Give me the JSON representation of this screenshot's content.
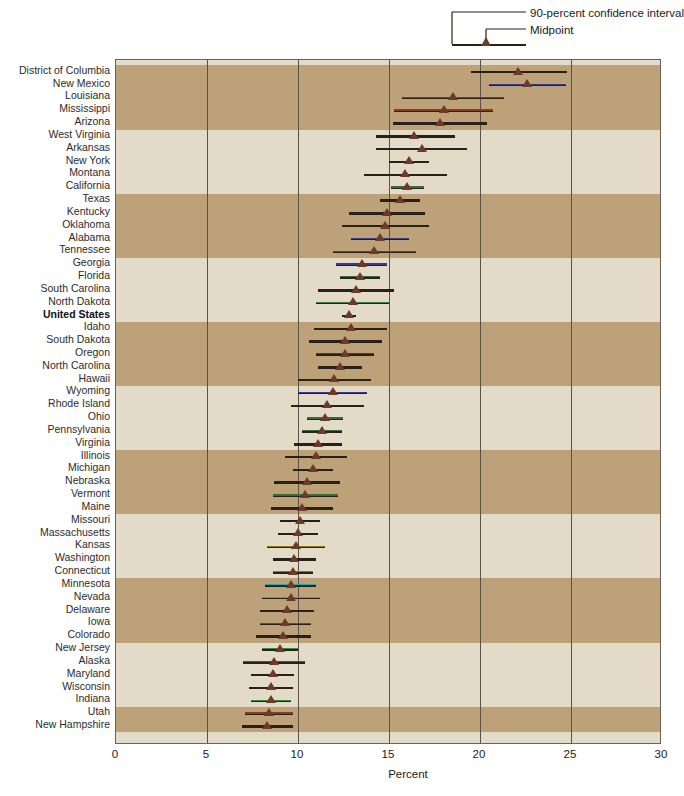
{
  "legend": {
    "ci_label": "90-percent confidence interval",
    "midpoint_label": "Midpoint"
  },
  "axis": {
    "xlabel": "Percent",
    "ticks": [
      "0",
      "5",
      "10",
      "15",
      "20",
      "25",
      "30"
    ]
  },
  "colors": {
    "band_dark": "#bda178",
    "band_light": "#e4dac8",
    "marker": "#6b3b2a",
    "line": "#2b2018",
    "grid": "#5b5147"
  },
  "chart_data": {
    "type": "scatter",
    "title": "",
    "xlabel": "Percent",
    "ylabel": "",
    "xlim": [
      0,
      30
    ],
    "xticks": [
      0,
      5,
      10,
      15,
      20,
      25,
      30
    ],
    "grid": true,
    "legend_position": "top-right",
    "series_description": "Midpoint estimate with 90-percent confidence interval per state, sorted descending",
    "categories": [
      "District of Columbia",
      "New Mexico",
      "Louisiana",
      "Mississippi",
      "Arizona",
      "West Virginia",
      "Arkansas",
      "New York",
      "Montana",
      "California",
      "Texas",
      "Kentucky",
      "Oklahoma",
      "Alabama",
      "Tennessee",
      "Georgia",
      "Florida",
      "South Carolina",
      "North Dakota",
      "United States",
      "Idaho",
      "South Dakota",
      "Oregon",
      "North Carolina",
      "Hawaii",
      "Wyoming",
      "Rhode Island",
      "Ohio",
      "Pennsylvania",
      "Virginia",
      "Illinois",
      "Michigan",
      "Nebraska",
      "Vermont",
      "Maine",
      "Missouri",
      "Massachusetts",
      "Kansas",
      "Washington",
      "Connecticut",
      "Minnesota",
      "Nevada",
      "Delaware",
      "Iowa",
      "Colorado",
      "New Jersey",
      "Alaska",
      "Maryland",
      "Wisconsin",
      "Indiana",
      "Utah",
      "New Hampshire"
    ],
    "midpoints": [
      22.1,
      22.6,
      18.5,
      18.0,
      17.8,
      16.4,
      16.8,
      16.1,
      15.9,
      16.0,
      15.6,
      14.9,
      14.8,
      14.5,
      14.2,
      13.5,
      13.4,
      13.2,
      13.0,
      12.8,
      12.9,
      12.6,
      12.6,
      12.3,
      12.0,
      11.9,
      11.6,
      11.5,
      11.3,
      11.1,
      11.0,
      10.8,
      10.5,
      10.4,
      10.2,
      10.1,
      10.0,
      9.9,
      9.8,
      9.7,
      9.6,
      9.6,
      9.4,
      9.3,
      9.2,
      9.0,
      8.7,
      8.6,
      8.5,
      8.5,
      8.4,
      8.3
    ],
    "ci_low": [
      19.5,
      20.5,
      15.7,
      15.3,
      15.2,
      14.3,
      14.3,
      15.0,
      13.6,
      15.1,
      14.5,
      12.8,
      12.4,
      12.9,
      11.9,
      12.1,
      12.3,
      11.1,
      11.0,
      12.4,
      10.9,
      10.6,
      11.0,
      11.1,
      10.0,
      10.0,
      9.6,
      10.5,
      10.2,
      9.8,
      9.3,
      9.7,
      8.7,
      8.6,
      8.5,
      9.0,
      8.9,
      8.3,
      8.6,
      8.6,
      8.2,
      8.0,
      7.9,
      7.9,
      7.7,
      8.0,
      7.0,
      7.4,
      7.3,
      7.4,
      7.1,
      6.9
    ],
    "ci_high": [
      24.8,
      24.7,
      21.3,
      20.7,
      20.4,
      18.6,
      19.3,
      17.2,
      18.2,
      16.9,
      16.7,
      17.0,
      17.2,
      16.1,
      16.5,
      14.9,
      14.5,
      15.3,
      15.0,
      13.2,
      14.9,
      14.6,
      14.2,
      13.5,
      14.0,
      13.8,
      13.6,
      12.5,
      12.4,
      12.4,
      12.7,
      11.9,
      12.3,
      12.2,
      11.9,
      11.2,
      11.1,
      11.5,
      11.0,
      10.8,
      11.0,
      11.2,
      10.9,
      10.7,
      10.7,
      10.0,
      10.4,
      9.8,
      9.7,
      9.6,
      9.7,
      9.7
    ],
    "accent_colors": [
      "#2b2018",
      "#3a3a8c",
      "#6b4a2a",
      "#8c3b20",
      "#2b2018",
      "#2b2018",
      "#2b2018",
      "#2b2018",
      "#2b2018",
      "#3b6b3b",
      "#2b2018",
      "#2b2018",
      "#2b2018",
      "#3a3a8c",
      "#6b4a2a",
      "#3a3a8c",
      "#3b6b3b",
      "#2b2018",
      "#3b7a3b",
      "#2b2018",
      "#2b2018",
      "#2b2018",
      "#3a3a8c",
      "#2b2018",
      "#2b2018",
      "#3a3a8c",
      "#2b2018",
      "#3b6b3b",
      "#3b6b3b",
      "#2b2018",
      "#2b2018",
      "#2b2018",
      "#2b2018",
      "#3b6b3b",
      "#2b2018",
      "#2b2018",
      "#2b2018",
      "#8a7a20",
      "#2b2018",
      "#c94a7a",
      "#2aa8b8",
      "#3bb85a",
      "#2b2018",
      "#8c3b20",
      "#2b2018",
      "#3b8a3b",
      "#8c3b20",
      "#2b2018",
      "#2b2018",
      "#3b8a3b",
      "#8c3b20",
      "#2b2018"
    ]
  }
}
